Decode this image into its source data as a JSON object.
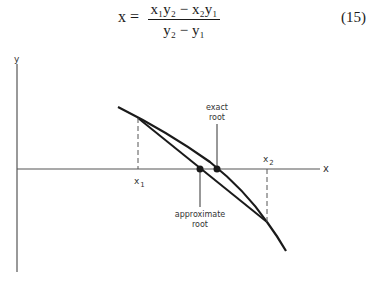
{
  "equation": {
    "lhs": "x =",
    "numerator": "x₁y₂ − x₂y₁",
    "denominator": "y₂ − y₁",
    "number": "(15)"
  },
  "figure": {
    "y_axis_label": "y",
    "x_axis_label": "x",
    "x1_label": "x",
    "x1_sub": "1",
    "x2_label": "x",
    "x2_sub": "2",
    "exact_root_line1": "exact",
    "exact_root_line2": "root",
    "approx_root_line1": "approximate",
    "approx_root_line2": "root"
  }
}
